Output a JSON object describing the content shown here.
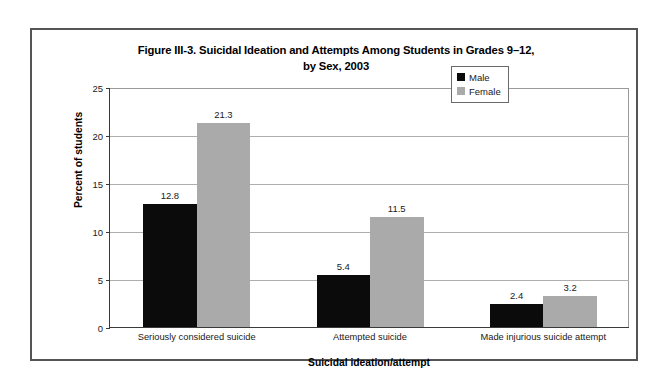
{
  "chart_data": {
    "type": "bar",
    "title": "Figure III-3. Suicidal Ideation and Attempts Among Students in Grades 9–12, by Sex, 2003",
    "title_line1": "Figure III-3. Suicidal Ideation and Attempts Among Students in Grades 9–12,",
    "title_line2": "by Sex, 2003",
    "xlabel": "Suicidal ideation/attempt",
    "ylabel": "Percent of students",
    "ylim": [
      0,
      25
    ],
    "ytick_values": [
      0,
      5,
      10,
      15,
      20,
      25
    ],
    "ytick_labels": [
      "0",
      "5",
      "10",
      "15",
      "20",
      "25"
    ],
    "grid": true,
    "grid_axis": "y",
    "legend_position": "top-right",
    "categories": [
      "Seriously considered suicide",
      "Attempted suicide",
      "Made injurious suicide attempt"
    ],
    "series": [
      {
        "name": "Male",
        "color": "#0b0b0b",
        "values": [
          12.8,
          5.4,
          2.4
        ],
        "labels": [
          "12.8",
          "5.4",
          "2.4"
        ]
      },
      {
        "name": "Female",
        "color": "#aaaaaa",
        "values": [
          21.3,
          11.5,
          3.2
        ],
        "labels": [
          "21.3",
          "11.5",
          "3.2"
        ]
      }
    ]
  },
  "legend": {
    "items": [
      {
        "label": "Male",
        "swatch": "male-swatch"
      },
      {
        "label": "Female",
        "swatch": "female-swatch"
      }
    ]
  }
}
